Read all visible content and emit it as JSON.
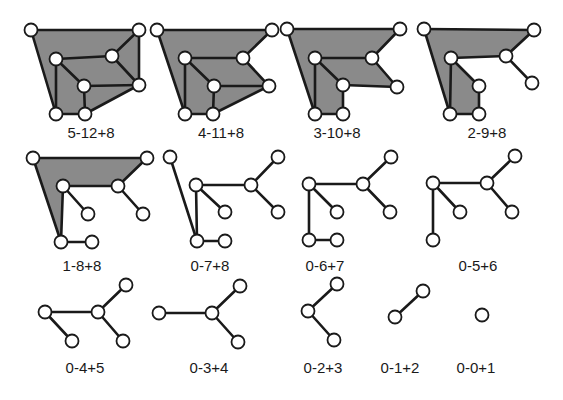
{
  "figure": {
    "description": "Sequence of planar graphs reduced step by step, labelled faces-edges+vertices",
    "colors": {
      "face_fill": "#8a8a8a",
      "edge": "#1a1a1a",
      "node_fill": "#ffffff",
      "background": "#ffffff"
    },
    "node_radius": 6.5,
    "graphs": [
      {
        "label": "5-12+8",
        "label_pos": [
          91,
          133
        ],
        "nodes": {
          "A": [
            31,
            30
          ],
          "B": [
            139,
            30
          ],
          "C": [
            56,
            59
          ],
          "D": [
            112,
            56
          ],
          "E": [
            84,
            86
          ],
          "F": [
            139,
            85
          ],
          "G": [
            56,
            114
          ],
          "H": [
            85,
            114
          ]
        },
        "faces": [
          [
            "A",
            "B",
            "F",
            "H",
            "G"
          ]
        ],
        "edges": [
          [
            "A",
            "B"
          ],
          [
            "A",
            "G"
          ],
          [
            "B",
            "D"
          ],
          [
            "B",
            "F"
          ],
          [
            "C",
            "D"
          ],
          [
            "C",
            "E"
          ],
          [
            "C",
            "G"
          ],
          [
            "D",
            "F"
          ],
          [
            "E",
            "F"
          ],
          [
            "E",
            "H"
          ],
          [
            "G",
            "H"
          ],
          [
            "H",
            "F"
          ]
        ]
      },
      {
        "label": "4-11+8",
        "label_pos": [
          221,
          133
        ],
        "nodes": {
          "A": [
            157,
            30
          ],
          "B": [
            272,
            30
          ],
          "C": [
            185,
            58
          ],
          "D": [
            243,
            58
          ],
          "E": [
            214,
            86
          ],
          "F": [
            269,
            86
          ],
          "G": [
            185,
            114
          ],
          "H": [
            213,
            114
          ]
        },
        "faces": [
          [
            "A",
            "B",
            "D",
            "F",
            "H",
            "G"
          ]
        ],
        "edges": [
          [
            "A",
            "B"
          ],
          [
            "A",
            "G"
          ],
          [
            "B",
            "D"
          ],
          [
            "C",
            "D"
          ],
          [
            "C",
            "E"
          ],
          [
            "C",
            "G"
          ],
          [
            "D",
            "F"
          ],
          [
            "E",
            "F"
          ],
          [
            "E",
            "H"
          ],
          [
            "G",
            "H"
          ],
          [
            "H",
            "F"
          ]
        ]
      },
      {
        "label": "3-10+8",
        "label_pos": [
          337,
          133
        ],
        "nodes": {
          "A": [
            287,
            29
          ],
          "B": [
            400,
            29
          ],
          "C": [
            315,
            58
          ],
          "D": [
            372,
            58
          ],
          "E": [
            343,
            85
          ],
          "F": [
            397,
            87
          ],
          "G": [
            315,
            114
          ],
          "H": [
            343,
            114
          ]
        },
        "faces": [
          [
            "A",
            "B",
            "D",
            "F",
            "E",
            "H",
            "G"
          ]
        ],
        "edges": [
          [
            "A",
            "B"
          ],
          [
            "A",
            "G"
          ],
          [
            "B",
            "D"
          ],
          [
            "C",
            "D"
          ],
          [
            "C",
            "E"
          ],
          [
            "C",
            "G"
          ],
          [
            "D",
            "F"
          ],
          [
            "E",
            "F"
          ],
          [
            "E",
            "H"
          ],
          [
            "G",
            "H"
          ]
        ]
      },
      {
        "label": "2-9+8",
        "label_pos": [
          487,
          133
        ],
        "nodes": {
          "A": [
            424,
            29
          ],
          "B": [
            534,
            30
          ],
          "C": [
            451,
            58
          ],
          "D": [
            506,
            56
          ],
          "E": [
            479,
            86
          ],
          "F": [
            532,
            83
          ],
          "G": [
            450,
            114
          ],
          "H": [
            479,
            114
          ]
        },
        "faces": [
          [
            "A",
            "B",
            "D",
            "C",
            "G"
          ],
          [
            "C",
            "E",
            "H",
            "G"
          ]
        ],
        "edges": [
          [
            "A",
            "B"
          ],
          [
            "A",
            "G"
          ],
          [
            "B",
            "D"
          ],
          [
            "C",
            "D"
          ],
          [
            "C",
            "E"
          ],
          [
            "C",
            "G"
          ],
          [
            "D",
            "F"
          ],
          [
            "E",
            "H"
          ],
          [
            "G",
            "H"
          ]
        ]
      },
      {
        "label": "1-8+8",
        "label_pos": [
          82,
          266
        ],
        "nodes": {
          "A": [
            33,
            158
          ],
          "B": [
            147,
            158
          ],
          "C": [
            63,
            186
          ],
          "D": [
            118,
            186
          ],
          "E": [
            88,
            214
          ],
          "F": [
            143,
            214
          ],
          "G": [
            61,
            242
          ],
          "H": [
            92,
            242
          ]
        },
        "faces": [
          [
            "A",
            "B",
            "D",
            "C",
            "G"
          ]
        ],
        "edges": [
          [
            "A",
            "B"
          ],
          [
            "A",
            "G"
          ],
          [
            "B",
            "D"
          ],
          [
            "C",
            "D"
          ],
          [
            "C",
            "E"
          ],
          [
            "C",
            "G"
          ],
          [
            "D",
            "F"
          ],
          [
            "G",
            "H"
          ]
        ]
      },
      {
        "label": "0-7+8",
        "label_pos": [
          210,
          266
        ],
        "nodes": {
          "A": [
            170,
            157
          ],
          "B": [
            278,
            157
          ],
          "C": [
            196,
            185
          ],
          "D": [
            251,
            185
          ],
          "E": [
            225,
            212
          ],
          "F": [
            278,
            212
          ],
          "G": [
            197,
            241
          ],
          "H": [
            225,
            241
          ]
        },
        "faces": [],
        "edges": [
          [
            "A",
            "G"
          ],
          [
            "B",
            "D"
          ],
          [
            "C",
            "D"
          ],
          [
            "C",
            "E"
          ],
          [
            "C",
            "G"
          ],
          [
            "D",
            "F"
          ],
          [
            "G",
            "H"
          ]
        ]
      },
      {
        "label": "0-6+7",
        "label_pos": [
          325,
          266
        ],
        "nodes": {
          "B": [
            391,
            157
          ],
          "C": [
            309,
            184
          ],
          "D": [
            363,
            184
          ],
          "E": [
            337,
            212
          ],
          "F": [
            390,
            212
          ],
          "G": [
            309,
            240
          ],
          "H": [
            337,
            240
          ]
        },
        "faces": [],
        "edges": [
          [
            "B",
            "D"
          ],
          [
            "C",
            "D"
          ],
          [
            "C",
            "E"
          ],
          [
            "C",
            "G"
          ],
          [
            "D",
            "F"
          ],
          [
            "G",
            "H"
          ]
        ]
      },
      {
        "label": "0-5+6",
        "label_pos": [
          478,
          266
        ],
        "nodes": {
          "B": [
            515,
            156
          ],
          "C": [
            433,
            183
          ],
          "D": [
            487,
            183
          ],
          "E": [
            460,
            212
          ],
          "F": [
            512,
            212
          ],
          "G": [
            433,
            240
          ]
        },
        "faces": [],
        "edges": [
          [
            "B",
            "D"
          ],
          [
            "C",
            "D"
          ],
          [
            "C",
            "E"
          ],
          [
            "C",
            "G"
          ],
          [
            "D",
            "F"
          ]
        ]
      },
      {
        "label": "0-4+5",
        "label_pos": [
          85,
          368
        ],
        "nodes": {
          "B": [
            126,
            285
          ],
          "C": [
            45,
            312
          ],
          "D": [
            98,
            312
          ],
          "E": [
            72,
            341
          ],
          "F": [
            123,
            341
          ]
        },
        "faces": [],
        "edges": [
          [
            "B",
            "D"
          ],
          [
            "C",
            "D"
          ],
          [
            "C",
            "E"
          ],
          [
            "D",
            "F"
          ]
        ]
      },
      {
        "label": "0-3+4",
        "label_pos": [
          209,
          368
        ],
        "nodes": {
          "B": [
            240,
            286
          ],
          "C": [
            159,
            313
          ],
          "D": [
            212,
            313
          ],
          "F": [
            238,
            342
          ]
        },
        "faces": [],
        "edges": [
          [
            "B",
            "D"
          ],
          [
            "C",
            "D"
          ],
          [
            "D",
            "F"
          ]
        ]
      },
      {
        "label": "0-2+3",
        "label_pos": [
          323,
          368
        ],
        "nodes": {
          "B": [
            337,
            284
          ],
          "D": [
            308,
            311
          ],
          "F": [
            334,
            340
          ]
        },
        "faces": [],
        "edges": [
          [
            "B",
            "D"
          ],
          [
            "D",
            "F"
          ]
        ]
      },
      {
        "label": "0-1+2",
        "label_pos": [
          400,
          368
        ],
        "nodes": {
          "B": [
            423,
            291
          ],
          "D": [
            395,
            317
          ]
        },
        "faces": [],
        "edges": [
          [
            "B",
            "D"
          ]
        ]
      },
      {
        "label": "0-0+1",
        "label_pos": [
          476,
          368
        ],
        "nodes": {
          "D": [
            482,
            315
          ]
        },
        "faces": [],
        "edges": []
      }
    ]
  }
}
